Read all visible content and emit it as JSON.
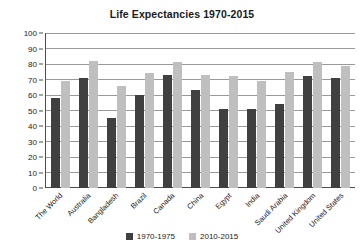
{
  "chart_data": {
    "type": "bar",
    "title": "Life Expectancies 1970-2015",
    "xlabel": "",
    "ylabel": "",
    "ylim": [
      0,
      100
    ],
    "yticks": [
      0,
      10,
      20,
      30,
      40,
      50,
      60,
      70,
      80,
      90,
      100
    ],
    "grid": true,
    "legend_position": "bottom",
    "categories": [
      "The World",
      "Australia",
      "Bangladesh",
      "Brazil",
      "Canada",
      "China",
      "Egypt",
      "India",
      "Saudi Arabia",
      "United Kingdom",
      "United States"
    ],
    "series": [
      {
        "name": "1970-1975",
        "color": "#404040",
        "values": [
          58,
          71,
          45,
          60,
          73,
          63,
          51,
          51,
          54,
          72,
          71
        ]
      },
      {
        "name": "2010-2015",
        "color": "#bfbfbf",
        "values": [
          69,
          82,
          66,
          74,
          81,
          73,
          72,
          69,
          75,
          81,
          79
        ]
      }
    ]
  }
}
